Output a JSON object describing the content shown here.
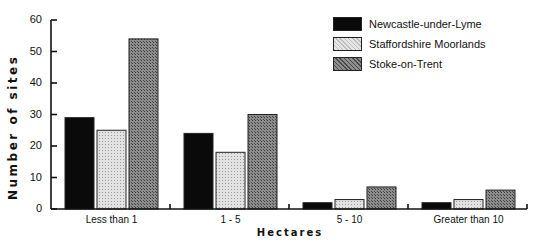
{
  "chart_data": {
    "type": "bar",
    "title": "",
    "xlabel": "Hectares",
    "ylabel": "Number of sites",
    "ylim": [
      0,
      60
    ],
    "yticks": [
      0,
      10,
      20,
      30,
      40,
      50,
      60
    ],
    "grid": false,
    "legend_position": "top-right",
    "categories": [
      "Less than 1",
      "1 - 5",
      "5 - 10",
      "Greater than 10"
    ],
    "series": [
      {
        "name": "Newcastle-under-Lyme",
        "values": [
          29,
          24,
          2,
          2
        ],
        "color": "#0a0a0a"
      },
      {
        "name": "Staffordshire Moorlands",
        "values": [
          25,
          18,
          3,
          3
        ],
        "color": "#d6d6d6"
      },
      {
        "name": "Stoke-on-Trent",
        "values": [
          54,
          30,
          7,
          6
        ],
        "color": "#7a7a7a"
      }
    ]
  }
}
